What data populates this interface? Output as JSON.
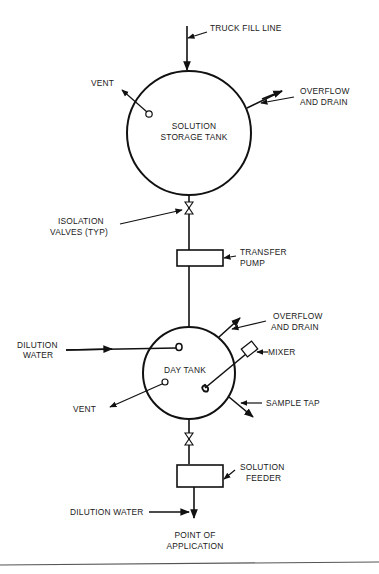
{
  "diagram": {
    "type": "process-flow-schematic",
    "components": {
      "storage_tank": {
        "label_line1": "SOLUTION",
        "label_line2": "STORAGE TANK"
      },
      "transfer_pump": {
        "label_line1": "TRANSFER",
        "label_line2": "PUMP"
      },
      "day_tank": {
        "label": "DAY TANK"
      },
      "solution_feeder": {
        "label_line1": "SOLUTION",
        "label_line2": "FEEDER"
      },
      "mixer": {
        "label": "MIXER"
      }
    },
    "labels": {
      "truck_fill_line": "TRUCK FILL LINE",
      "vent_top": "VENT",
      "overflow_top_line1": "OVERFLOW",
      "overflow_top_line2": "AND DRAIN",
      "isolation_line1": "ISOLATION",
      "isolation_line2": "VALVES (TYP)",
      "dilution_water_upper_line1": "DILUTION",
      "dilution_water_upper_line2": "WATER",
      "overflow_lower_line1": "OVERFLOW",
      "overflow_lower_line2": "AND DRAIN",
      "vent_lower": "VENT",
      "sample_tap": "SAMPLE TAP",
      "dilution_water_lower": "DILUTION WATER",
      "point_line1": "POINT OF",
      "point_line2": "APPLICATION"
    },
    "flow_sequence": [
      "TRUCK FILL LINE",
      "SOLUTION STORAGE TANK",
      "ISOLATION VALVE",
      "TRANSFER PUMP",
      "DAY TANK",
      "ISOLATION VALVE",
      "SOLUTION FEEDER",
      "POINT OF APPLICATION"
    ]
  }
}
